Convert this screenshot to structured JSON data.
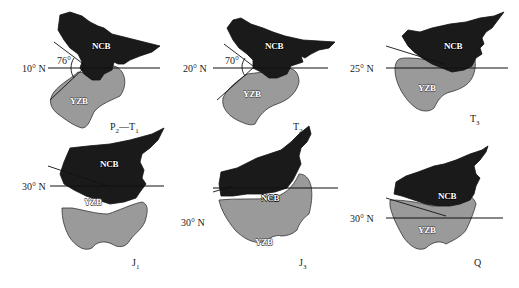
{
  "figure": {
    "type": "paleogeographic-reconstruction",
    "blocks": {
      "north": "NCB",
      "south": "YZB"
    },
    "colors": {
      "ncb_fill": "#1a1a1a",
      "yzb_fill": "#9a9a9a",
      "background": "#ffffff"
    },
    "panels": [
      {
        "id": "p1",
        "latitude": "10° N",
        "angle": "76°",
        "period": "P",
        "period_sub": "2",
        "period_sep": "—",
        "period2": "T",
        "period2_sub": "1"
      },
      {
        "id": "p2",
        "latitude": "20° N",
        "angle": "70°",
        "period": "T",
        "period_sub": "2",
        "period_sep": "",
        "period2": "",
        "period2_sub": ""
      },
      {
        "id": "p3",
        "latitude": "25° N",
        "angle": "",
        "period": "T",
        "period_sub": "3",
        "period_sep": "",
        "period2": "",
        "period2_sub": ""
      },
      {
        "id": "p4",
        "latitude": "30° N",
        "angle": "",
        "period": "J",
        "period_sub": "1",
        "period_sep": "",
        "period2": "",
        "period2_sub": ""
      },
      {
        "id": "p5",
        "latitude": "30° N",
        "angle": "",
        "period": "J",
        "period_sub": "3",
        "period_sep": "",
        "period2": "",
        "period2_sub": ""
      },
      {
        "id": "p6",
        "latitude": "30° N",
        "angle": "",
        "period": "Q",
        "period_sub": "",
        "period_sep": "",
        "period2": "",
        "period2_sub": ""
      }
    ]
  }
}
